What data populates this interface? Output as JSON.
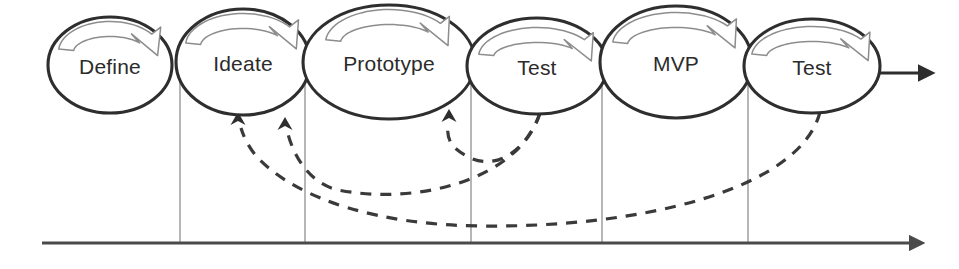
{
  "diagram": {
    "colors": {
      "ellipse_stroke": "#2e2e2e",
      "ellipse_fill": "#ffffff",
      "label_text": "#2b2b2b",
      "loop_arrow_stroke": "#8d8d8d",
      "divider_stroke": "#7b7b7b",
      "baseline_stroke": "#4a4a4a",
      "feedback_stroke": "#3a3a3a"
    },
    "stages": [
      {
        "id": "define",
        "label": "Define",
        "cx": 110,
        "cy": 65,
        "rx": 62,
        "ry": 48
      },
      {
        "id": "ideate",
        "label": "Ideate",
        "cx": 243,
        "cy": 62,
        "rx": 67,
        "ry": 53
      },
      {
        "id": "prototype",
        "label": "Prototype",
        "cx": 389,
        "cy": 62,
        "rx": 86,
        "ry": 57
      },
      {
        "id": "test-1",
        "label": "Test",
        "cx": 537,
        "cy": 66,
        "rx": 70,
        "ry": 48
      },
      {
        "id": "mvp",
        "label": "MVP",
        "cx": 676,
        "cy": 62,
        "rx": 76,
        "ry": 56
      },
      {
        "id": "test-2",
        "label": "Test",
        "cx": 812,
        "cy": 66,
        "rx": 68,
        "ry": 47
      }
    ],
    "dividers": [
      {
        "id": "divider-1",
        "x": 180
      },
      {
        "id": "divider-2",
        "x": 305
      },
      {
        "id": "divider-3",
        "x": 471
      },
      {
        "id": "divider-4",
        "x": 602
      },
      {
        "id": "divider-5",
        "x": 748
      }
    ],
    "baseline": {
      "id": "timeline-axis",
      "x_start": 42,
      "x_end": 922,
      "y": 243
    },
    "flow_arrow": {
      "id": "process-output-arrow",
      "x_start": 878,
      "x_end": 932,
      "y": 73
    },
    "feedback_arcs": [
      {
        "id": "feedback-test1-to-prototype",
        "from_stage": "test-1",
        "to_stage": "prototype",
        "path": "M 540,113 C 527,150 492,180 455,148 C 448,141 447,133 448,124",
        "arrow_at": {
          "x": 449,
          "y": 115,
          "angle": -72
        }
      },
      {
        "id": "feedback-test1-to-ideate",
        "from_stage": "test-1",
        "to_stage": "ideate",
        "path": "M 540,113 C 520,178 420,206 338,190 C 312,184 295,160 288,134",
        "arrow_at": {
          "x": 285,
          "y": 123,
          "angle": -74
        }
      },
      {
        "id": "feedback-test2-to-ideate",
        "from_stage": "test-2",
        "to_stage": "ideate",
        "path": "M 820,112 C 800,190 640,228 480,226 C 380,225 300,200 260,160 C 250,150 244,138 241,128",
        "arrow_at": {
          "x": 238,
          "y": 118,
          "angle": -72
        }
      }
    ],
    "loop_arrows": [
      {
        "id": "loop-define",
        "stage": "define",
        "cx": 110,
        "cy": 52,
        "rx": 44,
        "ry": 23
      },
      {
        "id": "loop-ideate",
        "stage": "ideate",
        "cx": 243,
        "cy": 46,
        "rx": 50,
        "ry": 25
      },
      {
        "id": "loop-prototype",
        "stage": "prototype",
        "cx": 389,
        "cy": 43,
        "rx": 56,
        "ry": 26
      },
      {
        "id": "loop-test-1",
        "stage": "test-1",
        "cx": 537,
        "cy": 57,
        "rx": 51,
        "ry": 22
      },
      {
        "id": "loop-mvp",
        "stage": "mvp",
        "cx": 676,
        "cy": 45,
        "rx": 56,
        "ry": 25
      },
      {
        "id": "loop-test-2",
        "stage": "test-2",
        "cx": 812,
        "cy": 57,
        "rx": 53,
        "ry": 23
      }
    ]
  }
}
